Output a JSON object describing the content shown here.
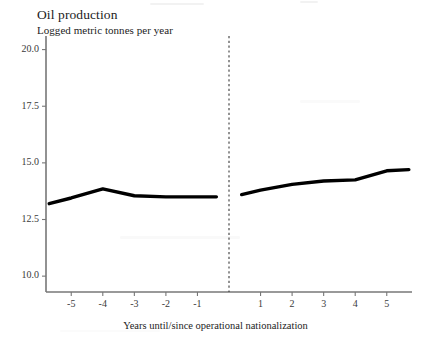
{
  "chart_data": {
    "type": "line",
    "title": "Oil production",
    "subtitle": "Logged metric tonnes per year",
    "xlabel": "Years until/since operational nationalization",
    "ylabel": "",
    "grid": false,
    "legend": "none",
    "xlim": [
      -5.8,
      5.8
    ],
    "ylim": [
      9.3,
      20.6
    ],
    "yticks": [
      20.0,
      17.5,
      15.0,
      12.5,
      10.0
    ],
    "ytick_labels": [
      "20.0",
      "17.5",
      "15.0",
      "12.5",
      "10.0"
    ],
    "xticks": [
      -5,
      -4,
      -3,
      -2,
      -1,
      1,
      2,
      3,
      4,
      5
    ],
    "xtick_labels": [
      "-5",
      "-4",
      "-3",
      "-2",
      "-1",
      "1",
      "2",
      "3",
      "4",
      "5"
    ],
    "annotations": [
      {
        "name": "nationalization-divider",
        "type": "vline",
        "x": 0,
        "style": "dashed"
      }
    ],
    "series": [
      {
        "name": "Pre-nationalization",
        "x": [
          -5.7,
          -5,
          -4,
          -3,
          -2,
          -1,
          -0.4
        ],
        "values": [
          13.2,
          13.45,
          13.85,
          13.55,
          13.5,
          13.5,
          13.5
        ]
      },
      {
        "name": "Post-nationalization",
        "x": [
          0.4,
          1,
          2,
          3,
          4,
          5,
          5.7
        ],
        "values": [
          13.6,
          13.8,
          14.05,
          14.2,
          14.25,
          14.65,
          14.7
        ]
      }
    ]
  },
  "colors": {
    "line": "#000000",
    "axis": "#777777",
    "divider": "#3a3a3a",
    "text": "#1c1c1c",
    "background": "#ffffff"
  }
}
